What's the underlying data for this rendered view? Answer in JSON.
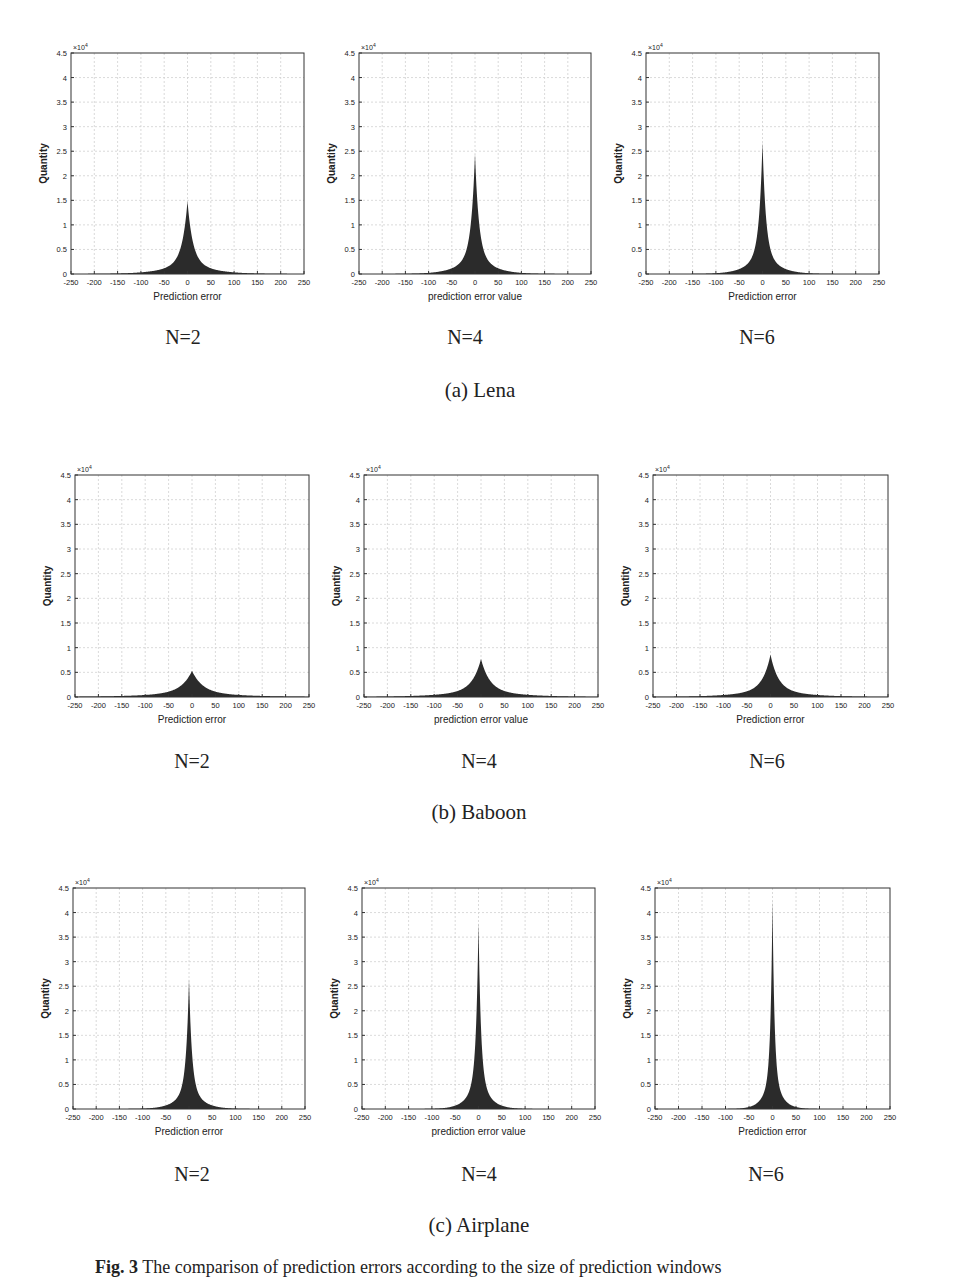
{
  "figure": {
    "caption_prefix": "Fig. 3",
    "caption_text": "The comparison of prediction errors according to the size of prediction windows"
  },
  "groups": [
    {
      "caption": "(a) Lena",
      "plots": [
        {
          "n_label": "N=2",
          "xlabel": "Prediction error",
          "ylabel": "Quantity",
          "peak": 1.48,
          "width": 11
        },
        {
          "n_label": "N=4",
          "xlabel": "prediction error value",
          "ylabel": "Quantity",
          "peak": 2.45,
          "width": 8
        },
        {
          "n_label": "N=6",
          "xlabel": "Prediction error",
          "ylabel": "Quantity",
          "peak": 2.68,
          "width": 7
        }
      ]
    },
    {
      "caption": "(b) Baboon",
      "plots": [
        {
          "n_label": "N=2",
          "xlabel": "Prediction error",
          "ylabel": "Quantity",
          "peak": 0.53,
          "width": 22
        },
        {
          "n_label": "N=4",
          "xlabel": "prediction error value",
          "ylabel": "Quantity",
          "peak": 0.77,
          "width": 18
        },
        {
          "n_label": "N=6",
          "xlabel": "Prediction error",
          "ylabel": "Quantity",
          "peak": 0.86,
          "width": 16
        }
      ]
    },
    {
      "caption": "(c) Airplane",
      "plots": [
        {
          "n_label": "N=2",
          "xlabel": "Prediction error",
          "ylabel": "Quantity",
          "peak": 2.65,
          "width": 6
        },
        {
          "n_label": "N=4",
          "xlabel": "prediction error value",
          "ylabel": "Quantity",
          "peak": 3.8,
          "width": 5
        },
        {
          "n_label": "N=6",
          "xlabel": "Prediction error",
          "ylabel": "Quantity",
          "peak": 4.25,
          "width": 4
        }
      ]
    }
  ],
  "axes": {
    "exponent_label": "×10",
    "exponent_power": "4",
    "x_ticks": [
      "-250",
      "-200",
      "-150",
      "-100",
      "-50",
      "0",
      "50",
      "100",
      "150",
      "200",
      "250"
    ],
    "y_ticks": [
      "0",
      "0.5",
      "1",
      "1.5",
      "2",
      "2.5",
      "3",
      "3.5",
      "4",
      "4.5"
    ]
  },
  "colors": {
    "fill": "#2b2b2b",
    "axis": "#333333",
    "grid": "#d0d0d0"
  },
  "chart_data": [
    {
      "type": "area",
      "title": "Lena N=2",
      "xlabel": "Prediction error",
      "ylabel": "Quantity",
      "xlim": [
        -250,
        250
      ],
      "ylim": [
        0,
        45000
      ],
      "grid": true,
      "x": [
        -250,
        -100,
        -50,
        -25,
        -10,
        0,
        10,
        25,
        50,
        100,
        250
      ],
      "values": [
        0,
        50,
        400,
        1500,
        5000,
        14800,
        5000,
        1500,
        400,
        50,
        0
      ]
    },
    {
      "type": "area",
      "title": "Lena N=4",
      "xlabel": "prediction error value",
      "ylabel": "Quantity",
      "xlim": [
        -250,
        250
      ],
      "ylim": [
        0,
        45000
      ],
      "grid": true,
      "x": [
        -250,
        -100,
        -50,
        -25,
        -10,
        0,
        10,
        25,
        50,
        100,
        250
      ],
      "values": [
        0,
        30,
        250,
        1200,
        5500,
        24500,
        5500,
        1200,
        250,
        30,
        0
      ]
    },
    {
      "type": "area",
      "title": "Lena N=6",
      "xlabel": "Prediction error",
      "ylabel": "Quantity",
      "xlim": [
        -250,
        250
      ],
      "ylim": [
        0,
        45000
      ],
      "grid": true,
      "x": [
        -250,
        -100,
        -50,
        -25,
        -10,
        0,
        10,
        25,
        50,
        100,
        250
      ],
      "values": [
        0,
        30,
        200,
        1100,
        5500,
        26800,
        5500,
        1100,
        200,
        30,
        0
      ]
    },
    {
      "type": "area",
      "title": "Baboon N=2",
      "xlabel": "Prediction error",
      "ylabel": "Quantity",
      "xlim": [
        -250,
        250
      ],
      "ylim": [
        0,
        45000
      ],
      "grid": true,
      "x": [
        -250,
        -100,
        -50,
        -25,
        -10,
        0,
        10,
        25,
        50,
        100,
        250
      ],
      "values": [
        0,
        200,
        800,
        1800,
        3300,
        5300,
        3300,
        1800,
        800,
        200,
        0
      ]
    },
    {
      "type": "area",
      "title": "Baboon N=4",
      "xlabel": "prediction error value",
      "ylabel": "Quantity",
      "xlim": [
        -250,
        250
      ],
      "ylim": [
        0,
        45000
      ],
      "grid": true,
      "x": [
        -250,
        -100,
        -50,
        -25,
        -10,
        0,
        10,
        25,
        50,
        100,
        250
      ],
      "values": [
        0,
        150,
        700,
        1800,
        4000,
        7700,
        4000,
        1800,
        700,
        150,
        0
      ]
    },
    {
      "type": "area",
      "title": "Baboon N=6",
      "xlabel": "Prediction error",
      "ylabel": "Quantity",
      "xlim": [
        -250,
        250
      ],
      "ylim": [
        0,
        45000
      ],
      "grid": true,
      "x": [
        -250,
        -100,
        -50,
        -25,
        -10,
        0,
        10,
        25,
        50,
        100,
        250
      ],
      "values": [
        0,
        120,
        600,
        1800,
        4300,
        8600,
        4300,
        1800,
        600,
        120,
        0
      ]
    },
    {
      "type": "area",
      "title": "Airplane N=2",
      "xlabel": "Prediction error",
      "ylabel": "Quantity",
      "xlim": [
        -250,
        250
      ],
      "ylim": [
        0,
        45000
      ],
      "grid": true,
      "x": [
        -250,
        -100,
        -50,
        -25,
        -10,
        0,
        10,
        25,
        50,
        100,
        250
      ],
      "values": [
        0,
        20,
        150,
        800,
        4000,
        26500,
        4000,
        800,
        150,
        20,
        0
      ]
    },
    {
      "type": "area",
      "title": "Airplane N=4",
      "xlabel": "prediction error value",
      "ylabel": "Quantity",
      "xlim": [
        -250,
        250
      ],
      "ylim": [
        0,
        45000
      ],
      "grid": true,
      "x": [
        -250,
        -100,
        -50,
        -25,
        -10,
        0,
        10,
        25,
        50,
        100,
        250
      ],
      "values": [
        0,
        15,
        120,
        700,
        4000,
        38000,
        4000,
        700,
        120,
        15,
        0
      ]
    },
    {
      "type": "area",
      "title": "Airplane N=6",
      "xlabel": "Prediction error",
      "ylabel": "Quantity",
      "xlim": [
        -250,
        250
      ],
      "ylim": [
        0,
        45000
      ],
      "grid": true,
      "x": [
        -250,
        -100,
        -50,
        -25,
        -10,
        0,
        10,
        25,
        50,
        100,
        250
      ],
      "values": [
        0,
        10,
        100,
        600,
        3500,
        42500,
        3500,
        600,
        100,
        10,
        0
      ]
    }
  ]
}
